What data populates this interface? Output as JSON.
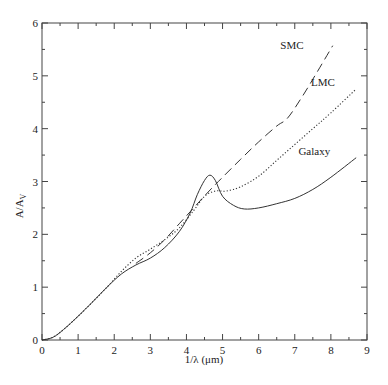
{
  "chart_data": {
    "type": "line",
    "title": "",
    "xlabel": "1/λ (μm)",
    "ylabel": "A/A_V",
    "ylabel_main": "A/A",
    "ylabel_sub": "V",
    "xlim": [
      0,
      9
    ],
    "ylim": [
      0,
      6
    ],
    "xticks": [
      0,
      1,
      2,
      3,
      4,
      5,
      6,
      7,
      8,
      9
    ],
    "yticks": [
      0,
      1,
      2,
      3,
      4,
      5,
      6
    ],
    "grid": false,
    "legend": "inline labels",
    "series": [
      {
        "name": "Galaxy",
        "style": "solid",
        "x": [
          0,
          0.3,
          0.6,
          1.0,
          1.4,
          1.8,
          2.2,
          2.6,
          3.0,
          3.4,
          3.8,
          4.1,
          4.3,
          4.5,
          4.65,
          4.8,
          5.0,
          5.3,
          5.6,
          6.0,
          6.5,
          7.0,
          7.5,
          8.0,
          8.7
        ],
        "y": [
          0,
          0.05,
          0.2,
          0.45,
          0.72,
          1.0,
          1.25,
          1.42,
          1.55,
          1.75,
          2.05,
          2.4,
          2.75,
          3.02,
          3.12,
          3.02,
          2.72,
          2.55,
          2.48,
          2.5,
          2.58,
          2.68,
          2.85,
          3.08,
          3.45
        ]
      },
      {
        "name": "LMC",
        "style": "dotted",
        "x": [
          0,
          0.3,
          0.6,
          1.0,
          1.4,
          1.8,
          2.2,
          2.6,
          3.0,
          3.4,
          3.8,
          4.2,
          4.5,
          4.8,
          5.1,
          5.5,
          6.0,
          6.5,
          7.0,
          7.5,
          8.0,
          8.7
        ],
        "y": [
          0,
          0.05,
          0.2,
          0.45,
          0.72,
          1.0,
          1.3,
          1.55,
          1.72,
          1.9,
          2.12,
          2.45,
          2.72,
          2.82,
          2.82,
          2.9,
          3.1,
          3.4,
          3.7,
          4.0,
          4.3,
          4.75
        ]
      },
      {
        "name": "SMC",
        "style": "dashed",
        "x": [
          2.6,
          3.0,
          3.4,
          3.8,
          4.2,
          4.6,
          5.0,
          5.5,
          6.0,
          6.5,
          6.8,
          7.2,
          7.6,
          8.05
        ],
        "y": [
          1.45,
          1.65,
          1.9,
          2.2,
          2.5,
          2.8,
          3.08,
          3.42,
          3.75,
          4.05,
          4.2,
          4.6,
          5.05,
          5.57
        ]
      }
    ],
    "annotations": [
      {
        "text": "SMC",
        "x": 6.6,
        "y": 5.5
      },
      {
        "text": "LMC",
        "x": 7.45,
        "y": 4.8
      },
      {
        "text": "Galaxy",
        "x": 7.1,
        "y": 3.5
      }
    ]
  }
}
